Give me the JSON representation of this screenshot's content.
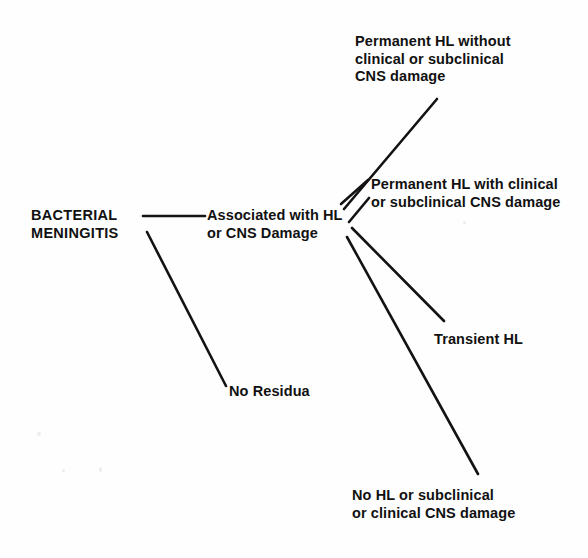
{
  "diagram": {
    "type": "tree",
    "background_color": "#fefefe",
    "line_color": "#131313",
    "text_color": "#111111",
    "nodes": [
      {
        "id": "root",
        "label": "BACTERIAL\nMENINGITIS",
        "x": 31,
        "y": 207,
        "style": "root"
      },
      {
        "id": "hub",
        "label": "Associated with HL\nor CNS Damage",
        "x": 207,
        "y": 207,
        "style": "hub"
      },
      {
        "id": "no-residua",
        "label": "No Residua",
        "x": 229,
        "y": 383,
        "style": "leaf"
      },
      {
        "id": "permanent-hl-without",
        "label": "Permanent HL without\nclinical or subclinical\nCNS damage",
        "x": 355,
        "y": 33,
        "style": "leaf"
      },
      {
        "id": "permanent-hl-with",
        "label": "Permanent HL with clinical\nor subclinical CNS damage",
        "x": 371,
        "y": 176,
        "style": "leaf"
      },
      {
        "id": "transient-hl",
        "label": "Transient HL",
        "x": 434,
        "y": 331,
        "style": "leaf"
      },
      {
        "id": "no-hl",
        "label": "No HL or subclinical\nor clinical CNS damage",
        "x": 352,
        "y": 487,
        "style": "leaf"
      }
    ],
    "edges": [
      {
        "id": "root-to-hub",
        "from": "root",
        "to": "hub",
        "x1": 143,
        "y1": 216,
        "x2": 205,
        "y2": 216
      },
      {
        "id": "root-to-no-residua",
        "from": "root",
        "to": "no-residua",
        "x1": 147,
        "y1": 232,
        "x2": 226,
        "y2": 386
      },
      {
        "id": "hub-to-permanent-hl-without",
        "from": "hub",
        "to": "permanent-hl-without",
        "x1": 344,
        "y1": 209,
        "x2": 437,
        "y2": 99
      },
      {
        "id": "hub-to-permanent-hl-with",
        "from": "hub",
        "to": "permanent-hl-with",
        "x1": 341,
        "y1": 204,
        "x2": 368,
        "y2": 180
      },
      {
        "id": "hub-to-transient-hl",
        "from": "hub",
        "to": "transient-hl",
        "x1": 349,
        "y1": 222,
        "x2": 369,
        "y2": 198
      },
      {
        "id": "hub-to-transient-hl-main",
        "from": "hub",
        "to": "transient-hl",
        "x1": 352,
        "y1": 228,
        "x2": 444,
        "y2": 321
      },
      {
        "id": "hub-to-no-hl",
        "from": "hub",
        "to": "no-hl",
        "x1": 347,
        "y1": 237,
        "x2": 478,
        "y2": 474
      }
    ]
  }
}
